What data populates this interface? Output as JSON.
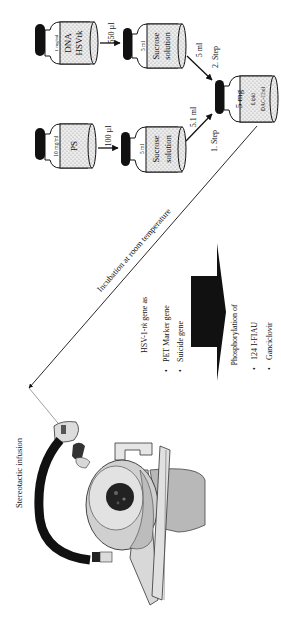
{
  "colors": {
    "ink": "#111111",
    "vial_fill": "#e6e6e6",
    "device_light": "#d6d6d6",
    "device_mid": "#b8b8b8",
    "device_dark": "#1a1a1a"
  },
  "vials": {
    "dna": {
      "concentration": "1 mg/ml",
      "line1": "DNA",
      "line2": "HSVtk"
    },
    "sucrose_top": {
      "volume": "5 ml",
      "line1": "Sucrose",
      "line2": "solution"
    },
    "ps": {
      "concentration": "10 mg/ml",
      "line1": "PS"
    },
    "sucrose_bottom": {
      "volume": "5 ml",
      "line1": "Sucrose",
      "line2": "solution"
    },
    "lipid": {
      "amount": "5 mg",
      "line1": "Lipid",
      "line2": "DAC-Chol"
    }
  },
  "arrows": {
    "dna_to_sucrose": "550 µl",
    "ps_to_sucrose": "100 µl",
    "top_sucrose_to_lipid": "5 ml",
    "bottom_sucrose_to_lipid": "5.1 ml"
  },
  "steps": {
    "step1": "1. Step",
    "step2": "2. Step"
  },
  "incubation": "Incubation at room temperature",
  "gene_info": {
    "heading": "HSV-1-tk gene as",
    "heading_prefix": "HSV-1-",
    "heading_italic": "tk",
    "heading_suffix": " gene as",
    "bullets": [
      "PET Marker gene",
      "Suicide gene"
    ]
  },
  "phosphorylation": {
    "heading": "Phosphorylation of",
    "bullets": [
      "124 I-FIAU",
      "Ganciclovir"
    ]
  },
  "infusion_label": "Stereotactic infusion"
}
